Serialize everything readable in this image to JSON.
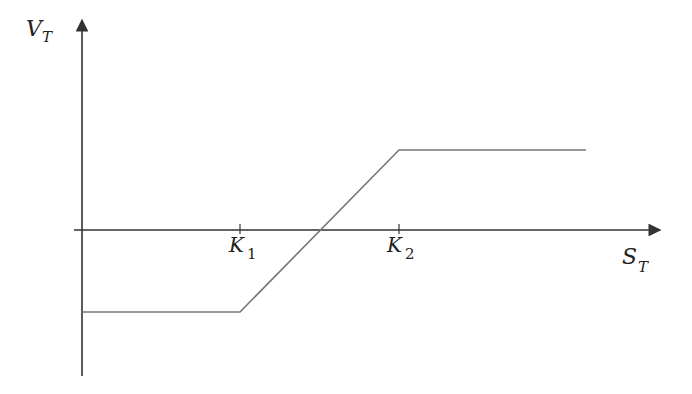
{
  "diagram": {
    "type": "payoff-diagram",
    "y_axis": {
      "label": "V",
      "subscript": "T"
    },
    "x_axis": {
      "label": "S",
      "subscript": "T"
    },
    "ticks": [
      {
        "label": "K",
        "subscript": "1"
      },
      {
        "label": "K",
        "subscript": "2"
      }
    ],
    "payoff_segments": [
      {
        "name": "lower-flat",
        "from": "S=0",
        "to": "K1",
        "level": "negative constant"
      },
      {
        "name": "rising",
        "from": "K1",
        "to": "K2",
        "crosses_zero": "between K1 and K2"
      },
      {
        "name": "upper-flat",
        "from": "K2",
        "to": "beyond",
        "level": "positive constant"
      }
    ],
    "colors": {
      "axis": "#333333",
      "payoff": "#777777"
    }
  }
}
